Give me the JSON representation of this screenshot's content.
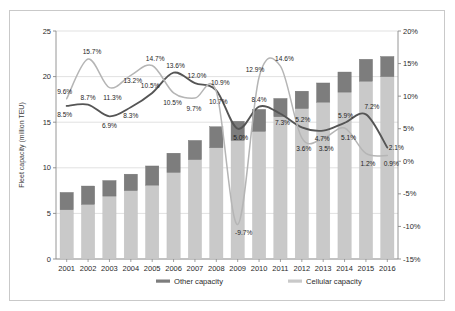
{
  "chart_data": {
    "type": "bar",
    "title": "",
    "subtitle": "",
    "xlabel": "",
    "ylabel": "Fleet capacity (million TEU)",
    "y2label": "",
    "categories": [
      "2001",
      "2002",
      "2003",
      "2004",
      "2005",
      "2006",
      "2007",
      "2008",
      "2009",
      "2010",
      "2011",
      "2012",
      "2013",
      "2014",
      "2015",
      "2016"
    ],
    "ylim": [
      0,
      25
    ],
    "yticks": [
      0,
      5,
      10,
      15,
      20,
      25
    ],
    "ytick_labels": [
      "0",
      "5",
      "10",
      "15",
      "20",
      "25"
    ],
    "y2lim": [
      -15,
      20
    ],
    "y2ticks": [
      -15,
      -10,
      -5,
      0,
      5,
      10,
      15,
      20
    ],
    "y2tick_labels": [
      "-15%",
      "-10%",
      "-5%",
      "0%",
      "5%",
      "10%",
      "15%",
      "20%"
    ],
    "grid": true,
    "legend_position": "bottom",
    "stacked": true,
    "series": [
      {
        "name": "Cellular capacity",
        "kind": "bar",
        "color": "#c9c9c9",
        "axis": "left",
        "values": [
          5.4,
          6.0,
          6.9,
          7.5,
          8.1,
          9.5,
          10.9,
          12.2,
          13.0,
          14.0,
          15.6,
          16.5,
          17.2,
          18.3,
          19.5,
          20.0
        ]
      },
      {
        "name": "Other capacity",
        "kind": "bar",
        "color": "#7d7d7d",
        "axis": "left",
        "values": [
          1.9,
          2.0,
          1.7,
          1.8,
          2.1,
          2.1,
          2.1,
          2.3,
          2.1,
          2.4,
          2.0,
          1.9,
          2.1,
          2.2,
          2.4,
          2.2
        ]
      },
      {
        "name": "Other capacity growth",
        "kind": "line",
        "color": "#555555",
        "axis": "right",
        "values": [
          8.5,
          8.7,
          6.9,
          8.3,
          10.5,
          13.6,
          12.0,
          10.9,
          5.0,
          8.4,
          7.3,
          5.2,
          4.7,
          5.9,
          7.2,
          2.1
        ],
        "labels": [
          "8.5%",
          "8.7%",
          "6.9%",
          "8.3%",
          "10.5%",
          "13.6%",
          "12.0%",
          "10.9%",
          "5.0%",
          "8.4%",
          "7.3%",
          "5.2%",
          "4.7%",
          "5.9%",
          "7.2%",
          "2.1%"
        ]
      },
      {
        "name": "Cellular capacity growth",
        "kind": "line",
        "color": "#b5b5b5",
        "axis": "right",
        "values": [
          9.6,
          15.7,
          11.3,
          13.2,
          14.7,
          10.5,
          9.7,
          10.7,
          -9.7,
          12.9,
          14.6,
          3.6,
          3.5,
          5.1,
          1.2,
          0.9
        ],
        "labels": [
          "9.6%",
          "15.7%",
          "11.3%",
          "13.2%",
          "14.7%",
          "10.5%",
          "9.7%",
          "10.7%",
          "-9.7%",
          "12.9%",
          "14.6%",
          "3.6%",
          "3.5%",
          "5.1%",
          "1.2%",
          "0.9%"
        ]
      }
    ],
    "legend": [
      {
        "label": "Other capacity",
        "color": "#7d7d7d"
      },
      {
        "label": "Cellular capacity",
        "color": "#c9c9c9"
      }
    ]
  }
}
